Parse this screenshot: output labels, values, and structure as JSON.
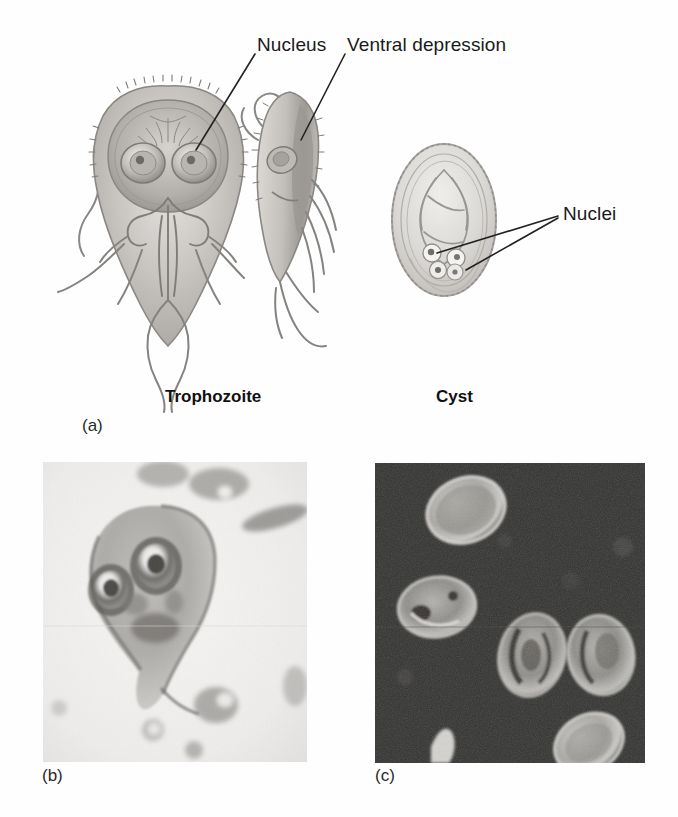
{
  "figure": {
    "organism": "Giardia",
    "panels": [
      {
        "letter": "(a)",
        "type": "line-drawing"
      },
      {
        "letter": "(b)",
        "type": "brightfield-micrograph"
      },
      {
        "letter": "(c)",
        "type": "darkfield-micrograph"
      }
    ]
  },
  "labels": {
    "nucleus": "Nucleus",
    "ventral_depression": "Ventral depression",
    "nuclei": "Nuclei"
  },
  "captions": {
    "trophozoite": "Trophozoite",
    "cyst": "Cyst"
  },
  "panel_letters": {
    "a": "(a)",
    "b": "(b)",
    "c": "(c)"
  },
  "colors": {
    "background": "#fefefe",
    "text": "#1a1a1a",
    "leader_line": "#222222",
    "drawing_fill": "#c9c6c2",
    "drawing_shade": "#a9a6a2",
    "drawing_outline": "#8d8a86",
    "panel_b_background": "#f2f1ef",
    "panel_c_background": "#2f2f2f",
    "cyst_bright": "#d8d6d2"
  },
  "drawing": {
    "trophozoite_frontal": {
      "description": "pear-shaped body, ventral adhesive disc, two nuclei, median bodies, eight flagella"
    },
    "trophozoite_lateral": {
      "description": "side view showing curved dorsal surface and ventral depression"
    },
    "cyst": {
      "description": "oval cyst with thick wall, internal axonemes and four nuclei"
    }
  }
}
